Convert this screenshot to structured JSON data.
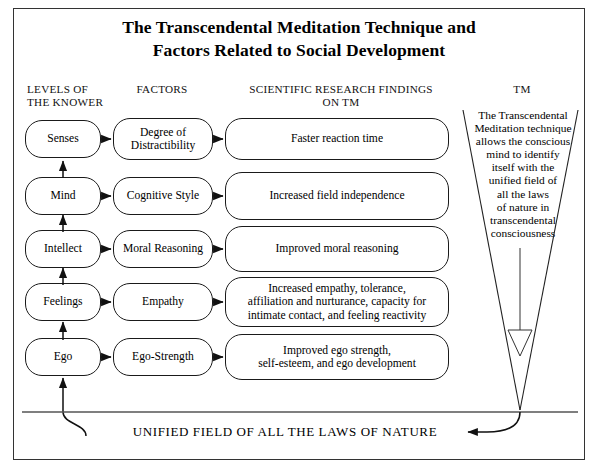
{
  "figure": {
    "title_line1": "The Transcendental Meditation Technique and",
    "title_line2": "Factors Related to Social Development",
    "border_color": "#333333",
    "node_border_color": "#1a1a1a",
    "background": "#ffffff"
  },
  "headers": {
    "levels_line1": "LEVELS OF",
    "levels_line2": "THE  KNOWER",
    "factors": "FACTORS",
    "findings_line1": "SCIENTIFIC RESEARCH FINDINGS",
    "findings_line2": "ON TM",
    "tm": "TM"
  },
  "rows": [
    {
      "level": "Senses",
      "factor": "Degree of\nDistractibility",
      "finding": "Faster reaction time"
    },
    {
      "level": "Mind",
      "factor": "Cognitive Style",
      "finding": "Increased field independence"
    },
    {
      "level": "Intellect",
      "factor": "Moral Reasoning",
      "finding": "Improved moral reasoning"
    },
    {
      "level": "Feelings",
      "factor": "Empathy",
      "finding": "Increased empathy, tolerance,\naffiliation and nurturance, capacity for\nintimate contact, and feeling  reactivity"
    },
    {
      "level": "Ego",
      "factor": "Ego-Strength",
      "finding": "Improved ego strength,\nself-esteem, and ego development"
    }
  ],
  "tm_panel": {
    "text": "The Transcendental\nMeditation technique\nallows the conscious\nmind to identify\nitself with the\nunified field of\nall the laws\nof nature in\ntranscendental\nconsciousness"
  },
  "footer": {
    "unified_field": "UNIFIED FIELD OF ALL THE LAWS OF NATURE"
  }
}
